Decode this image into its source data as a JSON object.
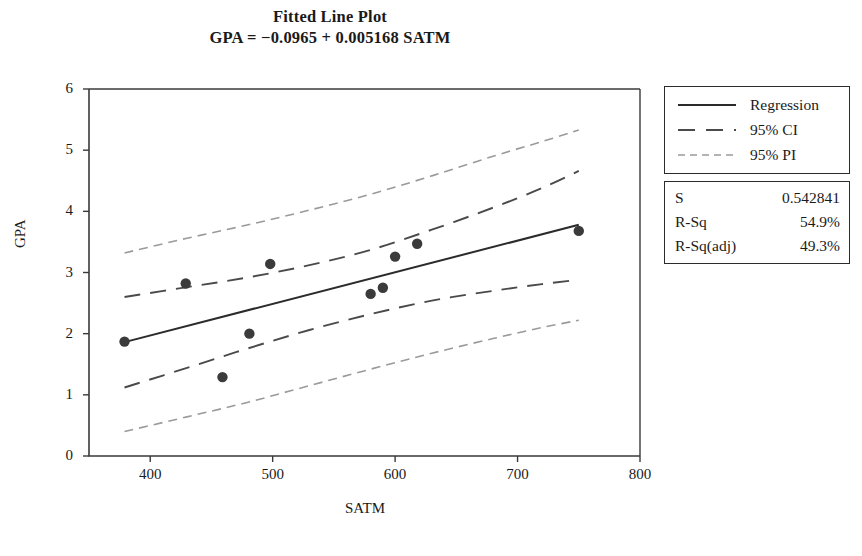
{
  "chart_data": {
    "type": "scatter",
    "title": "Fitted Line Plot",
    "subtitle": "GPA =  −0.0965 + 0.005168 SATM",
    "xlabel": "SATM",
    "ylabel": "GPA",
    "xlim": [
      350,
      800
    ],
    "ylim": [
      0,
      6
    ],
    "xticks": [
      400,
      500,
      600,
      700,
      800
    ],
    "yticks": [
      0,
      1,
      2,
      3,
      4,
      5,
      6
    ],
    "grid": false,
    "legend_position": "right",
    "points": [
      {
        "x": 379,
        "y": 1.87
      },
      {
        "x": 429,
        "y": 2.82
      },
      {
        "x": 459,
        "y": 1.29
      },
      {
        "x": 481,
        "y": 2.0
      },
      {
        "x": 498,
        "y": 3.14
      },
      {
        "x": 580,
        "y": 2.65
      },
      {
        "x": 590,
        "y": 2.75
      },
      {
        "x": 600,
        "y": 3.26
      },
      {
        "x": 618,
        "y": 3.47
      },
      {
        "x": 750,
        "y": 3.68
      }
    ],
    "regression": {
      "label": "Regression",
      "intercept": -0.0965,
      "slope": 0.005168,
      "x_start": 379,
      "x_end": 750
    },
    "confidence_interval": {
      "label": "95% CI",
      "upper": [
        [
          379,
          2.6
        ],
        [
          430,
          2.76
        ],
        [
          480,
          2.92
        ],
        [
          530,
          3.12
        ],
        [
          580,
          3.37
        ],
        [
          630,
          3.7
        ],
        [
          680,
          4.06
        ],
        [
          720,
          4.38
        ],
        [
          750,
          4.66
        ]
      ],
      "lower": [
        [
          379,
          1.12
        ],
        [
          430,
          1.44
        ],
        [
          480,
          1.76
        ],
        [
          530,
          2.06
        ],
        [
          580,
          2.32
        ],
        [
          630,
          2.54
        ],
        [
          680,
          2.7
        ],
        [
          720,
          2.81
        ],
        [
          750,
          2.88
        ]
      ]
    },
    "prediction_interval": {
      "label": "95% PI",
      "upper": [
        [
          379,
          3.32
        ],
        [
          430,
          3.56
        ],
        [
          480,
          3.78
        ],
        [
          530,
          4.02
        ],
        [
          580,
          4.28
        ],
        [
          630,
          4.58
        ],
        [
          680,
          4.9
        ],
        [
          720,
          5.14
        ],
        [
          750,
          5.33
        ]
      ],
      "lower": [
        [
          379,
          0.4
        ],
        [
          430,
          0.64
        ],
        [
          480,
          0.88
        ],
        [
          530,
          1.15
        ],
        [
          580,
          1.42
        ],
        [
          630,
          1.68
        ],
        [
          680,
          1.92
        ],
        [
          720,
          2.1
        ],
        [
          750,
          2.22
        ]
      ]
    },
    "stats": [
      {
        "key": "S",
        "value": "0.542841"
      },
      {
        "key": "R-Sq",
        "value": "54.9%"
      },
      {
        "key": "R-Sq(adj)",
        "value": "49.3%"
      }
    ],
    "colors": {
      "axis": "#3a3a3a",
      "regression": "#2b2b2b",
      "ci": "#4a4a4a",
      "pi": "#9a9a9a",
      "marker": "#3b3b3b",
      "text": "#1a1a1a"
    }
  }
}
